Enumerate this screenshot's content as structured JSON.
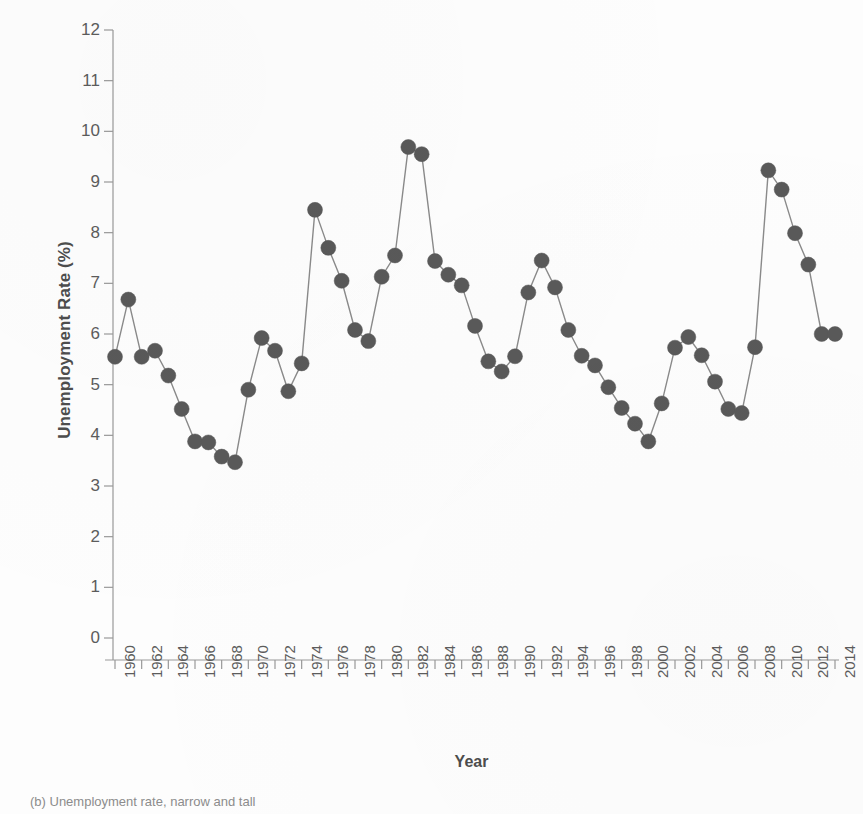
{
  "figure": {
    "caption": "(b) Unemployment rate, narrow and tall",
    "background_color": "#fdfdfd"
  },
  "axes": {
    "y_title": "Unemployment Rate (%)",
    "x_title": "Year",
    "y_tick_labels": [
      "12",
      "11",
      "10",
      "9",
      "8",
      "7",
      "6",
      "5",
      "4",
      "3",
      "2",
      "1",
      "0"
    ],
    "x_tick_labels": [
      "1960",
      "1962",
      "1964",
      "1966",
      "1968",
      "1970",
      "1972",
      "1974",
      "1976",
      "1978",
      "1980",
      "1982",
      "1984",
      "1986",
      "1988",
      "1990",
      "1992",
      "1994",
      "1996",
      "1998",
      "2000",
      "2002",
      "2004",
      "2006",
      "2008",
      "2010",
      "2012",
      "2014"
    ]
  },
  "style": {
    "marker_color": "#595959",
    "line_color": "#8a8a8a",
    "axis_color": "#999999",
    "text_color": "#5c5c5c",
    "title_color": "#4d4d4d",
    "marker_radius": 7.5,
    "line_width": 1.4
  },
  "chart_data": {
    "type": "line",
    "title": "",
    "subtitle": "",
    "xlabel": "Year",
    "ylabel": "Unemployment Rate (%)",
    "xlim": [
      1960,
      2014
    ],
    "ylim": [
      0,
      12
    ],
    "y_ticks": [
      0,
      1,
      2,
      3,
      4,
      5,
      6,
      7,
      8,
      9,
      10,
      11,
      12
    ],
    "x_ticks": [
      1960,
      1962,
      1964,
      1966,
      1968,
      1970,
      1972,
      1974,
      1976,
      1978,
      1980,
      1982,
      1984,
      1986,
      1988,
      1990,
      1992,
      1994,
      1996,
      1998,
      2000,
      2002,
      2004,
      2006,
      2008,
      2010,
      2012,
      2014
    ],
    "grid": false,
    "legend": false,
    "legend_position": "none",
    "markers": "filled-circle",
    "x": [
      1960,
      1961,
      1962,
      1963,
      1964,
      1965,
      1966,
      1967,
      1968,
      1969,
      1970,
      1971,
      1972,
      1973,
      1974,
      1975,
      1976,
      1977,
      1978,
      1979,
      1980,
      1981,
      1982,
      1983,
      1984,
      1985,
      1986,
      1987,
      1988,
      1989,
      1990,
      1991,
      1992,
      1993,
      1994,
      1995,
      1996,
      1997,
      1998,
      1999,
      2000,
      2001,
      2002,
      2003,
      2004,
      2005,
      2006,
      2007,
      2008,
      2009,
      2010,
      2011,
      2012,
      2013,
      2014
    ],
    "series": [
      {
        "name": "Unemployment rate",
        "values": [
          5.55,
          6.68,
          5.55,
          5.67,
          5.18,
          4.52,
          3.88,
          3.86,
          3.58,
          3.47,
          4.9,
          5.92,
          5.67,
          4.87,
          5.42,
          8.45,
          7.7,
          7.05,
          6.08,
          5.86,
          7.13,
          7.55,
          9.69,
          9.55,
          7.44,
          7.17,
          6.96,
          6.16,
          5.46,
          5.26,
          5.56,
          6.82,
          7.45,
          6.92,
          6.08,
          5.57,
          5.38,
          4.95,
          4.54,
          4.23,
          3.88,
          4.63,
          5.73,
          5.94,
          5.58,
          5.06,
          4.52,
          4.44,
          5.74,
          9.23,
          8.85,
          7.99,
          7.37,
          6.0,
          6.0
        ]
      }
    ],
    "notes": [
      "Highest value 9.69 at 1982",
      "Lowest value 3.47 at 1969",
      "Secondary peak 9.23 at 2009"
    ]
  }
}
